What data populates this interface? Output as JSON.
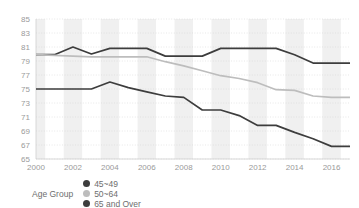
{
  "chart_data": {
    "type": "line",
    "title": "",
    "xlabel": "",
    "ylabel": "",
    "xlim": [
      2000,
      2017
    ],
    "ylim": [
      65,
      85
    ],
    "grid": true,
    "legend_position": "bottom-left",
    "legend_title": "Age Group",
    "x": [
      2000,
      2001,
      2002,
      2003,
      2004,
      2005,
      2006,
      2007,
      2008,
      2009,
      2010,
      2011,
      2012,
      2013,
      2014,
      2015,
      2016,
      2017
    ],
    "xtick_labels": [
      "2000",
      "2002",
      "2004",
      "2006",
      "2008",
      "2010",
      "2012",
      "2014",
      "2016"
    ],
    "xticks": [
      2000,
      2002,
      2004,
      2006,
      2008,
      2010,
      2012,
      2014,
      2016
    ],
    "ytick_labels": [
      "85",
      "83",
      "81",
      "79",
      "77",
      "75",
      "73",
      "71",
      "69",
      "67",
      "65"
    ],
    "yticks": [
      85,
      83,
      81,
      79,
      77,
      75,
      73,
      71,
      69,
      67,
      65
    ],
    "series": [
      {
        "name": "45~49",
        "color": "#3d3d3d",
        "values": [
          79.9,
          79.9,
          81.0,
          80.0,
          80.8,
          80.8,
          80.8,
          79.7,
          79.7,
          79.7,
          80.8,
          80.8,
          80.8,
          80.8,
          79.9,
          78.7,
          78.7,
          78.7
        ]
      },
      {
        "name": "50~64",
        "color": "#bdbdbd",
        "values": [
          79.9,
          79.8,
          79.7,
          79.6,
          79.6,
          79.6,
          79.6,
          78.9,
          78.3,
          77.6,
          76.9,
          76.5,
          75.9,
          74.9,
          74.8,
          74.0,
          73.8,
          73.8
        ]
      },
      {
        "name": "65 and Over",
        "color": "#3d3d3d",
        "values": [
          75.0,
          75.0,
          75.0,
          75.0,
          76.0,
          75.2,
          74.6,
          74.0,
          73.8,
          72.0,
          72.0,
          71.2,
          69.8,
          69.8,
          68.8,
          67.9,
          66.8,
          66.8
        ]
      }
    ]
  },
  "legend": {
    "title": "Age Group",
    "items": [
      {
        "label": "45~49",
        "color": "#3d3d3d"
      },
      {
        "label": "50~64",
        "color": "#bdbdbd"
      },
      {
        "label": "65 and Over",
        "color": "#3d3d3d"
      }
    ]
  },
  "colors": {
    "background": "#ffffff",
    "band": "#f0f0f0",
    "gridline": "#d8d8d8",
    "tick_text": "#9a9a9a",
    "legend_text": "#6e6e6e"
  }
}
